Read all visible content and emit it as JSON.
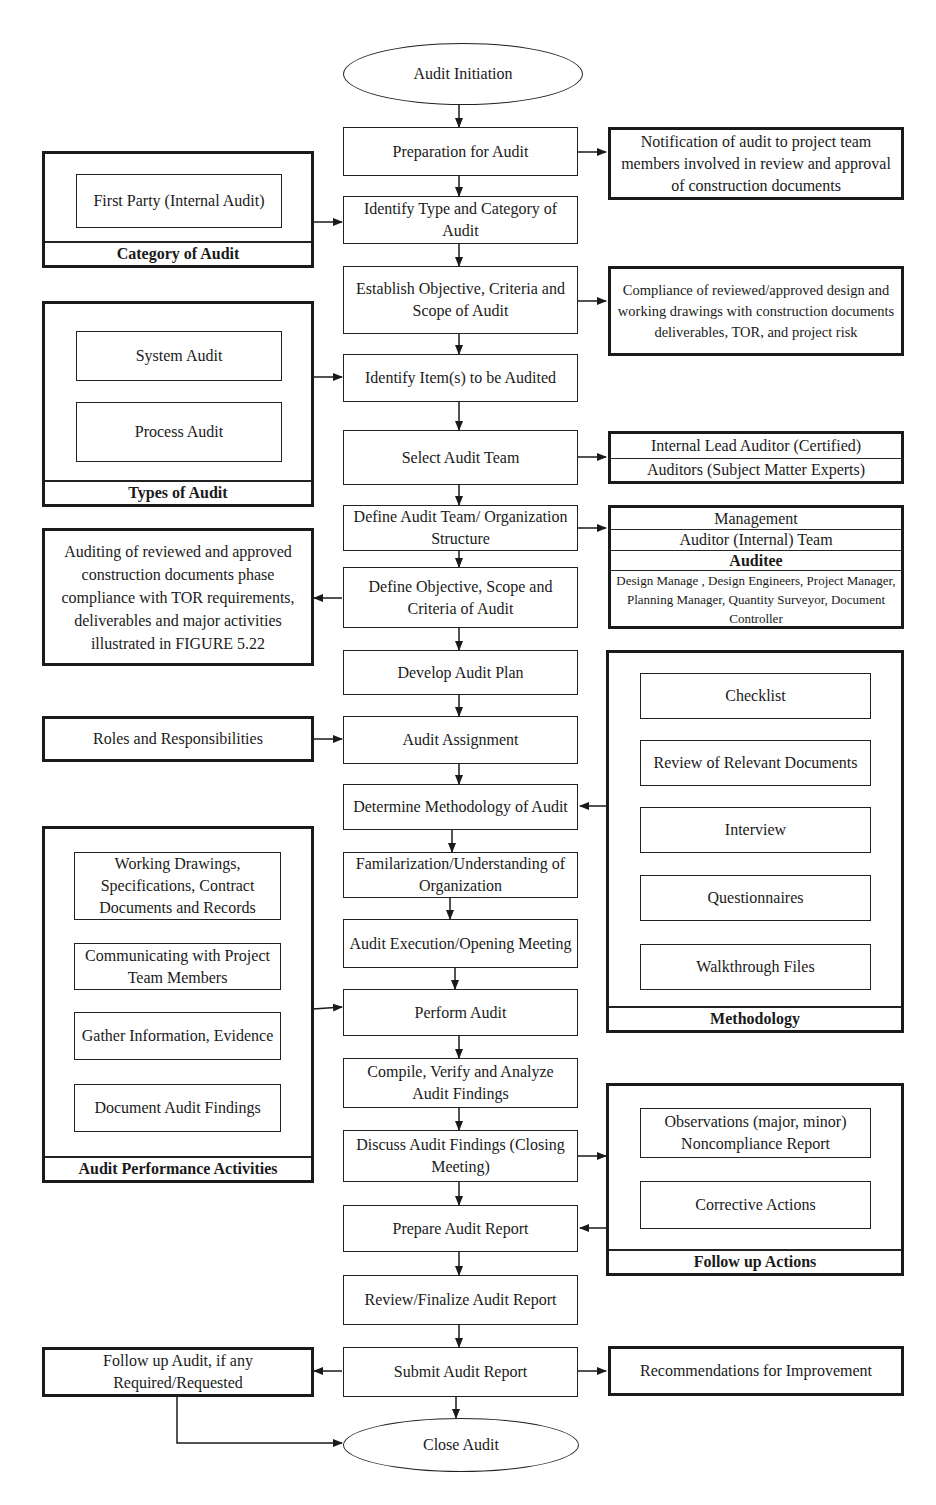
{
  "terminals": {
    "start": "Audit Initiation",
    "end": "Close Audit"
  },
  "main_flow": [
    "Preparation for Audit",
    "Identify Type and Category of Audit",
    "Establish Objective, Criteria and Scope of Audit",
    "Identify Item(s) to be Audited",
    "Select Audit Team",
    "Define Audit Team/ Organization Structure",
    "Define Objective, Scope and Criteria of Audit",
    "Develop Audit Plan",
    "Audit Assignment",
    "Determine Methodology of Audit",
    "Familarization/Understanding of Organization",
    "Audit Execution/Opening Meeting",
    "Perform Audit",
    "Compile, Verify and Analyze Audit Findings",
    "Discuss Audit Findings (Closing Meeting)",
    "Prepare Audit Report",
    "Review/Finalize Audit Report",
    "Submit Audit Report"
  ],
  "right_notes": {
    "notification": "Notification of audit to project team members involved in review and approval of construction documents",
    "compliance": "Compliance of reviewed/approved design and working drawings with construction documents deliverables, TOR, and project risk",
    "recommendations": "Recommendations for Improvement"
  },
  "audit_team_box": {
    "rows": [
      "Internal Lead Auditor (Certified)",
      "Auditors (Subject Matter Experts)"
    ]
  },
  "organization_box": {
    "management": "Management",
    "auditor_team": "Auditor (Internal) Team",
    "auditee_title": "Auditee",
    "auditee_members": "Design Manage , Design Engineers, Project Manager, Planning Manager, Quantity Surveyor, Document Controller"
  },
  "left_notes": {
    "auditing_scope": "Auditing of reviewed and approved construction documents phase compliance with TOR requirements, deliverables and major activities illustrated in FIGURE 5.22",
    "roles": "Roles and Responsibilities",
    "follow_up": "Follow up Audit, if any Required/Requested"
  },
  "groups": {
    "category": {
      "title": "Category of Audit",
      "items": [
        "First Party (Internal Audit)"
      ]
    },
    "types": {
      "title": "Types of Audit",
      "items": [
        "System Audit",
        "Process Audit"
      ]
    },
    "methodology": {
      "title": "Methodology",
      "items": [
        "Checklist",
        "Review of Relevant Documents",
        "Interview",
        "Questionnaires",
        "Walkthrough Files"
      ]
    },
    "performance": {
      "title": "Audit Performance Activities",
      "items": [
        "Working Drawings, Specifications, Contract Documents and Records",
        "Communicating with Project Team Members",
        "Gather Information, Evidence",
        "Document Audit Findings"
      ]
    },
    "follow_up": {
      "title": "Follow up Actions",
      "items": [
        "Observations (major, minor) Noncompliance Report",
        "Corrective Actions"
      ]
    }
  }
}
